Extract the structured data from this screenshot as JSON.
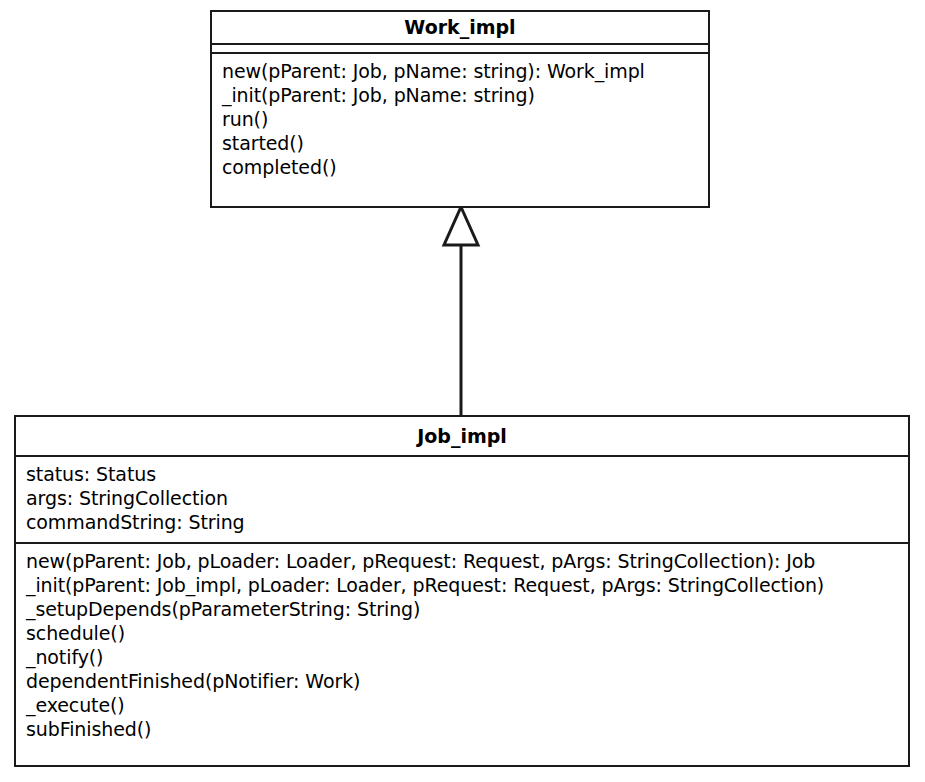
{
  "diagram": {
    "type": "uml-class-diagram",
    "background_color": "#ffffff",
    "line_color": "#1a1a1a"
  },
  "classes": [
    {
      "id": "work-impl",
      "name": "Work_impl",
      "attributes": [],
      "methods": [
        "new(pParent: Job, pName: string): Work_impl",
        "_init(pParent: Job, pName: string)",
        "run()",
        "started()",
        "completed()"
      ]
    },
    {
      "id": "job-impl",
      "name": "Job_impl",
      "attributes": [
        "status: Status",
        "args: StringCollection",
        "commandString: String"
      ],
      "methods": [
        "new(pParent: Job, pLoader: Loader, pRequest: Request, pArgs: StringCollection): Job",
        "_init(pParent: Job_impl, pLoader: Loader, pRequest: Request, pArgs: StringCollection)",
        "_setupDepends(pParameterString: String)",
        "schedule()",
        "_notify()",
        "dependentFinished(pNotifier: Work)",
        "_execute()",
        "subFinished()"
      ]
    }
  ],
  "relationships": [
    {
      "kind": "generalization",
      "label": "",
      "from": "Job_impl",
      "to": "Work_impl",
      "arrow": "hollow-triangle"
    }
  ]
}
